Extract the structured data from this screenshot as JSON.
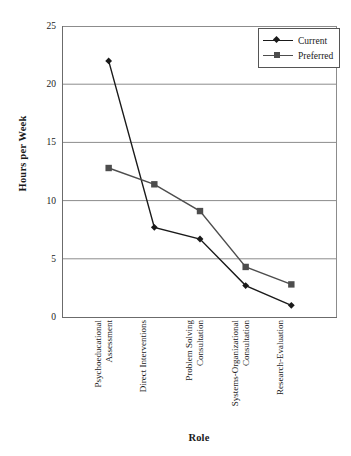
{
  "chart_data": {
    "type": "line",
    "title": "",
    "xlabel": "Role",
    "ylabel": "Hours per Week",
    "ylim": [
      0,
      25
    ],
    "ytick_values": [
      0,
      5,
      10,
      15,
      20,
      25
    ],
    "ytick_labels": [
      "0",
      "5",
      "10",
      "15",
      "20",
      "25"
    ],
    "grid": "horizontal",
    "legend_position": "top-right",
    "categories": [
      "Psychoeducational Assessment",
      "Direct Interventions",
      "Problem Solving Consultation",
      "Systems-Organizational Consultation",
      "Research-Evaluation"
    ],
    "category_lines": [
      [
        "Psychoeducational",
        "Assessment"
      ],
      [
        "Direct Interventions"
      ],
      [
        "Problem Solving",
        "Consultation"
      ],
      [
        "Systems-Organizational",
        "Consultation"
      ],
      [
        "Research-Evaluation"
      ]
    ],
    "series": [
      {
        "name": "Current",
        "marker": "diamond",
        "color": "#1a1a1a",
        "values": [
          22.0,
          7.7,
          6.7,
          2.7,
          1.0
        ]
      },
      {
        "name": "Preferred",
        "marker": "square",
        "color": "#4d4d4d",
        "values": [
          12.8,
          11.4,
          9.1,
          4.3,
          2.8
        ]
      }
    ]
  },
  "axis": {
    "y_title": "Hours per Week",
    "x_title": "Role"
  },
  "legend": {
    "items": [
      {
        "label": "Current"
      },
      {
        "label": "Preferred"
      }
    ]
  },
  "colors": {
    "current": "#1a1a1a",
    "preferred": "#4d4d4d",
    "grid": "#8c8c8c",
    "axis": "#6b6b6b",
    "background": "#ffffff"
  }
}
